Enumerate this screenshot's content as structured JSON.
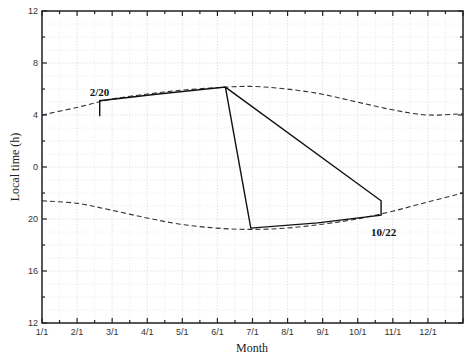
{
  "chart_data": {
    "type": "line",
    "title": "",
    "xlabel": "Month",
    "ylabel": "Local time (h)",
    "x_tick_labels": [
      "1/1",
      "2/1",
      "3/1",
      "4/1",
      "5/1",
      "6/1",
      "7/1",
      "8/1",
      "9/1",
      "10/1",
      "11/1",
      "12/1"
    ],
    "y_tick_labels": [
      "12",
      "8",
      "4",
      "0",
      "20",
      "16",
      "12"
    ],
    "y_axis_note": "Inverted local-time axis spanning noon to noon: top 12, descending through 0/24 to 12 at bottom",
    "xlim_day_of_year": [
      1,
      366
    ],
    "grid": true,
    "annotations": [
      {
        "text": "2/20",
        "day": 51,
        "hour": 5.8
      },
      {
        "text": "10/22",
        "day": 295,
        "hour": 19.0
      }
    ],
    "series": [
      {
        "name": "upper boundary (dashed)",
        "style": "dashed",
        "points_day_hour": [
          [
            1,
            4.0
          ],
          [
            32,
            4.6
          ],
          [
            60,
            5.2
          ],
          [
            91,
            5.6
          ],
          [
            121,
            5.9
          ],
          [
            152,
            6.1
          ],
          [
            182,
            6.2
          ],
          [
            213,
            6.0
          ],
          [
            244,
            5.6
          ],
          [
            274,
            5.0
          ],
          [
            305,
            4.4
          ],
          [
            335,
            4.0
          ],
          [
            366,
            4.1
          ]
        ]
      },
      {
        "name": "lower boundary (dashed)",
        "style": "dashed",
        "points_day_hour": [
          [
            1,
            21.4
          ],
          [
            32,
            21.2
          ],
          [
            60,
            20.7
          ],
          [
            91,
            20.1
          ],
          [
            121,
            19.6
          ],
          [
            152,
            19.3
          ],
          [
            182,
            19.2
          ],
          [
            213,
            19.3
          ],
          [
            244,
            19.6
          ],
          [
            274,
            20.0
          ],
          [
            305,
            20.6
          ],
          [
            335,
            21.3
          ],
          [
            366,
            22.0
          ]
        ]
      },
      {
        "name": "observation window (solid polygon)",
        "style": "solid",
        "points_day_hour": [
          [
            51,
            3.9
          ],
          [
            51,
            5.1
          ],
          [
            100,
            5.6
          ],
          [
            160,
            6.15
          ],
          [
            182,
            19.3
          ],
          [
            240,
            19.7
          ],
          [
            295,
            20.3
          ],
          [
            295,
            21.4
          ],
          [
            160,
            6.15
          ]
        ]
      }
    ]
  }
}
